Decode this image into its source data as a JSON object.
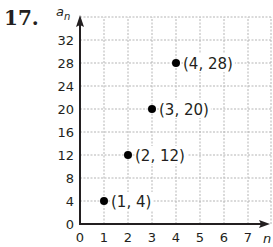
{
  "problem_number": "17.",
  "chart_data": {
    "type": "scatter",
    "title": "",
    "xlabel": "n",
    "ylabel": "a_n",
    "ylabel_display": {
      "base": "a",
      "sub": "n"
    },
    "x_ticks": [
      "0",
      "1",
      "2",
      "3",
      "4",
      "5",
      "6",
      "7"
    ],
    "y_ticks": [
      "0",
      "4",
      "8",
      "12",
      "16",
      "20",
      "24",
      "28",
      "32"
    ],
    "xlim": [
      0,
      7.5
    ],
    "ylim": [
      0,
      36
    ],
    "grid": true,
    "grid_style": "dashed",
    "legend": null,
    "points": [
      {
        "x": 1,
        "y": 4,
        "label": "(1, 4)"
      },
      {
        "x": 2,
        "y": 12,
        "label": "(2, 12)"
      },
      {
        "x": 3,
        "y": 20,
        "label": "(3, 20)"
      },
      {
        "x": 4,
        "y": 28,
        "label": "(4, 28)"
      }
    ],
    "colors": {
      "point": "#000000",
      "axis": "#231f20",
      "grid": "#b5b5b5"
    }
  }
}
